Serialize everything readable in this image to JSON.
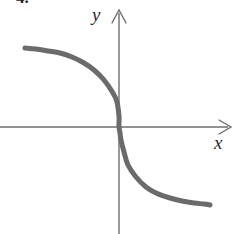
{
  "figure": {
    "problem_number": "4.",
    "background_color": "#ffffff"
  },
  "axes": {
    "x_label": "x",
    "y_label": "y",
    "axis_color": "#6e6e6e",
    "x_axis": {
      "y_pixel": 127,
      "start_x": 0,
      "end_x": 232,
      "arrow": "right"
    },
    "y_axis": {
      "x_pixel": 119,
      "start_y": 10,
      "end_y": 234,
      "arrow": "up"
    }
  },
  "chart_data": {
    "type": "line",
    "title": "",
    "xlabel": "x",
    "ylabel": "y",
    "grid": false,
    "legend": null,
    "curve_color": "#6b6b6b",
    "curve_width": 5,
    "xlim": [
      -4.7,
      4.6
    ],
    "ylim": [
      -4.2,
      4.6
    ],
    "x": [
      -4.7,
      -4.2,
      -3.7,
      -3.2,
      -2.7,
      -2.2,
      -1.8,
      -1.4,
      -1.0,
      -0.7,
      -0.4,
      -0.2,
      0.0,
      0.2,
      0.4,
      0.7,
      1.0,
      1.4,
      1.8,
      2.2,
      2.7,
      3.2,
      3.7,
      4.2,
      4.6
    ],
    "y": [
      3.1,
      3.05,
      2.97,
      2.86,
      2.7,
      2.45,
      2.15,
      1.75,
      1.25,
      0.85,
      0.45,
      0.22,
      0.0,
      -0.22,
      -0.45,
      -0.85,
      -1.25,
      -1.75,
      -2.15,
      -2.45,
      -2.7,
      -2.86,
      -2.97,
      -3.05,
      -3.1
    ],
    "points_pixels": [
      [
        25,
        48
      ],
      [
        36,
        49
      ],
      [
        48,
        51
      ],
      [
        60,
        53
      ],
      [
        72,
        57
      ],
      [
        84,
        63
      ],
      [
        94,
        70
      ],
      [
        104,
        80
      ],
      [
        113,
        93
      ],
      [
        117,
        102
      ],
      [
        119,
        116
      ],
      [
        119,
        122
      ],
      [
        119,
        127
      ],
      [
        120,
        133
      ],
      [
        121,
        140
      ],
      [
        124,
        152
      ],
      [
        128,
        165
      ],
      [
        136,
        177
      ],
      [
        146,
        187
      ],
      [
        156,
        193
      ],
      [
        170,
        198
      ],
      [
        182,
        201
      ],
      [
        194,
        203
      ],
      [
        204,
        204
      ],
      [
        210,
        205
      ]
    ],
    "asymptotes": {
      "left": 3.1,
      "right": -3.1
    }
  }
}
